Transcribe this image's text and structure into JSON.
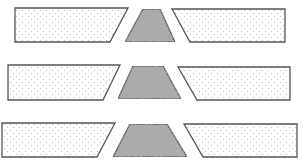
{
  "figure": {
    "width": 303,
    "height": 167,
    "background": "#ffffff",
    "stroke_color": "#555555",
    "dotted_fill": "#ffffff",
    "dot_color": "#b8b8b8",
    "speckled_fill": "#a8a8a8",
    "rows": [
      {
        "name": "row-1",
        "left": "15,8 128,8 110,42 15,42",
        "center": "143,9 160,9 175,42 125,42",
        "right": "172,9 285,9 285,42 190,42"
      },
      {
        "name": "row-2",
        "left": "8,65 120,65 103,100 8,100",
        "center": "133,66 163,66 181,99 118,99",
        "right": "178,67 290,67 290,100 197,100"
      },
      {
        "name": "row-3",
        "left": "2,123 115,123 97,157 2,157",
        "center": "130,124 167,124 187,157 113,157",
        "right": "184,124 297,124 297,157 203,157"
      }
    ]
  }
}
